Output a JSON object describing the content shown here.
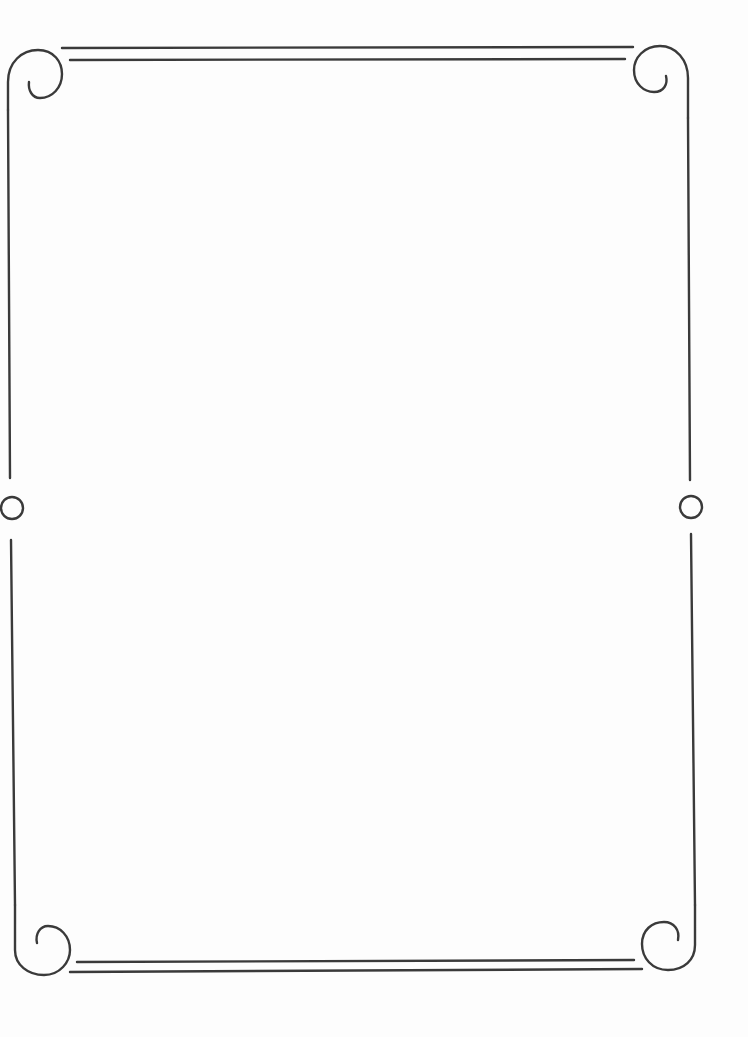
{
  "page": {
    "type": "decorative-frame",
    "background_color": "#fdfdfd",
    "line_color": "#3a3a3a"
  },
  "border": {
    "style": "double-line-with-spiral-corners",
    "corners": [
      {
        "position": "top-left",
        "ornament": "spiral-curl-icon"
      },
      {
        "position": "top-right",
        "ornament": "spiral-curl-icon"
      },
      {
        "position": "bottom-left",
        "ornament": "spiral-curl-icon"
      },
      {
        "position": "bottom-right",
        "ornament": "spiral-curl-icon"
      }
    ],
    "side_ornaments": [
      {
        "position": "left-middle",
        "ornament": "circle-icon"
      },
      {
        "position": "right-middle",
        "ornament": "circle-icon"
      }
    ],
    "horizontal_edges": "double-line",
    "vertical_edges": "single-line"
  },
  "content": {
    "text": ""
  }
}
